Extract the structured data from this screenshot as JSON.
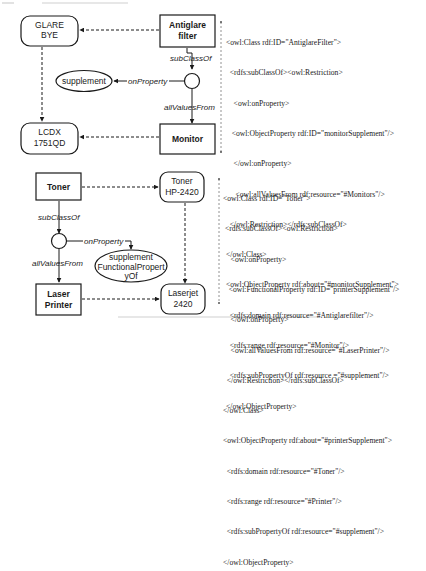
{
  "diagram1": {
    "nodes": {
      "glare_bye": [
        "GLARE",
        "BYE"
      ],
      "antiglare_filter": [
        "Antiglare",
        "filter"
      ],
      "supplement": "supplement",
      "lcdx": [
        "LCDX",
        "1751QD"
      ],
      "monitor": "Monitor"
    },
    "edges": {
      "subclassof": "subClassOf",
      "onproperty": "onProperty",
      "allvaluesfrom": "allValuesFrom"
    },
    "code_lines": [
      "<owl:Class rdf:ID=\"AntiglareFilter\">",
      "  <rdfs:subClassOf><owl:Restriction>",
      "    <owl:onProperty>",
      "   <owl:ObjectProperty rdf:ID=\"monitorSupplement\"/>",
      "    </owl:onProperty>",
      "     <owl:allValuesFrom rdf:resource=\"#Monitors\"/>",
      "  </owl:Restriction></rdfs:subClassOf>",
      "</owl:Class>",
      "<owl:ObjectProperty rdf:about=\"#monitorSupplement\">",
      "  <rdfs:domain rdf:resource=\"#Antiglarefilter\"/>",
      "  <rdfs:range rdf:resource=\"#Monitor\"/>",
      "  <rdfs:subPropertyOf rdf:resource =\"#supplement\"/>",
      "</owl:ObjectProperty>"
    ]
  },
  "diagram2": {
    "nodes": {
      "toner": "Toner",
      "toner_hp": [
        "Toner",
        "HP-2420"
      ],
      "supplement_fp": [
        "supplement",
        "FunctionalPropert",
        "yOf"
      ],
      "laser_printer": [
        "Laser",
        "Printer"
      ],
      "laserjet": [
        "Laserjet",
        "2420"
      ]
    },
    "edges": {
      "subclassof": "subClassOf",
      "onproperty": "onProperty",
      "allvaluesfrom": "allValuesFrom"
    },
    "code_lines": [
      "<owl:Class rdf:ID=\"Toner\">",
      " <rdfs:subClassOf><owl:Restriction>",
      "    <owl:onProperty>",
      "   <owl:FunctionalProperty rdf:ID=\"printerSupplement\"/>",
      "    </owl:onProperty>",
      "    <owl:allValuesFrom rdf:resource=\"#LaserPrinter\"/>",
      "  </owl:Restriction></rdfs:subClassOf>",
      "</owl:Class>",
      "<owl:ObjectProperty rdf:about=\"#printerSupplement\">",
      "  <rdfs:domain rdf:resource=\"#Toner\"/>",
      "  <rdfs:range rdf:resource=\"#Printer\"/>",
      "  <rdfs:subPropertyOf rdf:resource=\"#supplement\"/>",
      "</owl:ObjectProperty>"
    ]
  },
  "colors": {
    "ink": "#1a1a1a",
    "background": "#ffffff"
  }
}
